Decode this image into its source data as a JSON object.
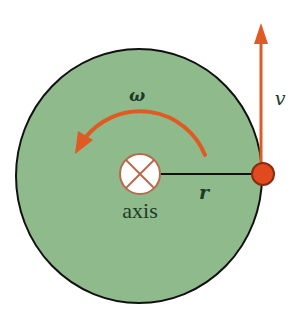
{
  "diagram": {
    "labels": {
      "angular_velocity": "ω",
      "velocity": "v",
      "radius": "r",
      "axis": "axis"
    },
    "colors": {
      "disk_fill": "#8fba8c",
      "disk_stroke": "#111111",
      "arrow": "#e05a24",
      "point_fill": "#e04a1e",
      "point_stroke": "#8a2a10",
      "axis_fill": "#ffffff",
      "axis_cross": "#b86a4e",
      "radius_line": "#111111",
      "text": "#1e3a28"
    },
    "axis_symbol": "into-page (circled X)",
    "rotation_direction": "counterclockwise"
  }
}
